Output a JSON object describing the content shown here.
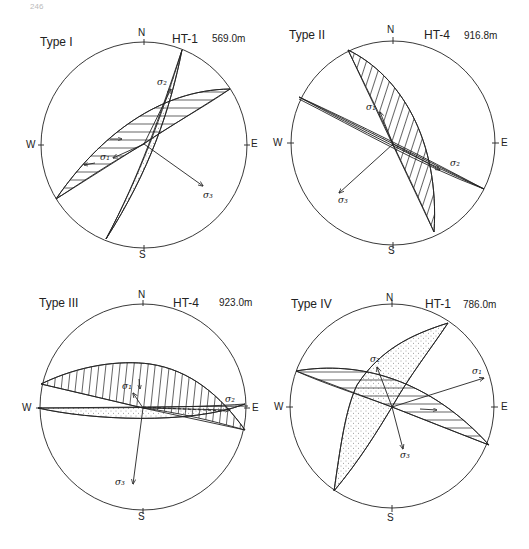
{
  "page": {
    "number": "246"
  },
  "panels": [
    {
      "id": "type-1",
      "type_label": "Type I",
      "well_label": "HT-1",
      "depth_label": "569.0m",
      "directions": {
        "n": "N",
        "s": "S",
        "e": "E",
        "w": "W"
      },
      "stresses": {
        "s1": "σ₁",
        "s2": "σ₂",
        "s3": "σ₃"
      }
    },
    {
      "id": "type-2",
      "type_label": "Type II",
      "well_label": "HT-4",
      "depth_label": "916.8m",
      "directions": {
        "n": "N",
        "s": "S",
        "e": "E",
        "w": "W"
      },
      "stresses": {
        "s1": "σ₁",
        "s2": "σ₂",
        "s3": "σ₃"
      }
    },
    {
      "id": "type-3",
      "type_label": "Type III",
      "well_label": "HT-4",
      "depth_label": "923.0m",
      "directions": {
        "n": "N",
        "s": "S",
        "e": "E",
        "w": "W"
      },
      "stresses": {
        "s1": "σ₁",
        "s2": "σ₂",
        "s3": "σ₃"
      }
    },
    {
      "id": "type-4",
      "type_label": "Type IV",
      "well_label": "HT-1",
      "depth_label": "786.0m",
      "directions": {
        "n": "N",
        "s": "S",
        "e": "E",
        "w": "W"
      },
      "stresses": {
        "s1": "σ₁",
        "s2": "σ₂",
        "s3": "σ₃"
      }
    }
  ],
  "colors": {
    "ink": "#222222",
    "background": "#ffffff"
  }
}
